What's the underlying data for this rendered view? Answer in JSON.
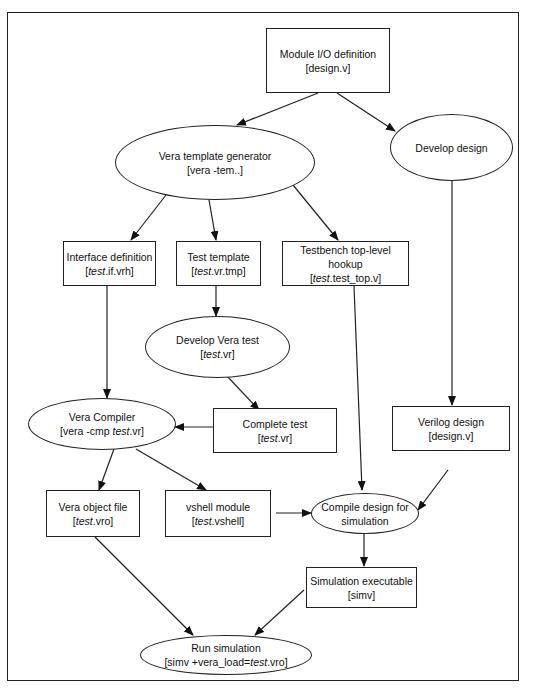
{
  "diagram": {
    "nodes": {
      "module_io": {
        "title": "Module I/O definition",
        "sub_pre": "[design.v]",
        "sub_it": "",
        "sub_post": ""
      },
      "template_gen": {
        "title": "Vera template generator",
        "sub_pre": "[vera -tem..]",
        "sub_it": "",
        "sub_post": ""
      },
      "develop_design": {
        "title": "Develop design"
      },
      "interface_def": {
        "title": "Interface definition",
        "sub_pre": "[",
        "sub_it": "test",
        "sub_post": ".if.vrh]"
      },
      "test_template": {
        "title": "Test template",
        "sub_pre": "[",
        "sub_it": "test",
        "sub_post": ".vr.tmp]"
      },
      "tb_hookup": {
        "title": "Testbench top-level hookup",
        "sub_pre": "[",
        "sub_it": "test",
        "sub_post": ".test_top.v]"
      },
      "develop_vera_test": {
        "title": "Develop Vera test",
        "sub_pre": "[",
        "sub_it": "test",
        "sub_post": ".vr]"
      },
      "vera_compiler": {
        "title": "Vera Compiler",
        "sub_pre": "[vera -cmp ",
        "sub_it": "test",
        "sub_post": ".vr]"
      },
      "complete_test": {
        "title": "Complete test",
        "sub_pre": "[",
        "sub_it": "test",
        "sub_post": ".vr]"
      },
      "verilog_design": {
        "title": "Verilog design",
        "sub_pre": "[design.v]",
        "sub_it": "",
        "sub_post": ""
      },
      "vera_object": {
        "title": "Vera object file",
        "sub_pre": "[",
        "sub_it": "test",
        "sub_post": ".vro]"
      },
      "vshell": {
        "title": "vshell module",
        "sub_pre": "[",
        "sub_it": "test",
        "sub_post": ".vshell]"
      },
      "compile_design": {
        "title": "Compile design for",
        "title2": "simulation"
      },
      "sim_exec": {
        "title": "Simulation executable",
        "sub_pre": "[simv]",
        "sub_it": "",
        "sub_post": ""
      },
      "run_sim": {
        "title": "Run simulation",
        "sub_pre": "[simv +vera_load=",
        "sub_it": "test",
        "sub_post": ".vro]"
      }
    },
    "edges": [
      [
        "module_io",
        "template_gen"
      ],
      [
        "module_io",
        "develop_design"
      ],
      [
        "template_gen",
        "interface_def"
      ],
      [
        "template_gen",
        "test_template"
      ],
      [
        "template_gen",
        "tb_hookup"
      ],
      [
        "test_template",
        "develop_vera_test"
      ],
      [
        "develop_vera_test",
        "complete_test"
      ],
      [
        "interface_def",
        "vera_compiler"
      ],
      [
        "complete_test",
        "vera_compiler"
      ],
      [
        "develop_design",
        "verilog_design"
      ],
      [
        "vera_compiler",
        "vera_object"
      ],
      [
        "vera_compiler",
        "vshell"
      ],
      [
        "tb_hookup",
        "compile_design"
      ],
      [
        "vshell",
        "compile_design"
      ],
      [
        "verilog_design",
        "compile_design"
      ],
      [
        "compile_design",
        "sim_exec"
      ],
      [
        "vera_object",
        "run_sim"
      ],
      [
        "sim_exec",
        "run_sim"
      ]
    ]
  }
}
